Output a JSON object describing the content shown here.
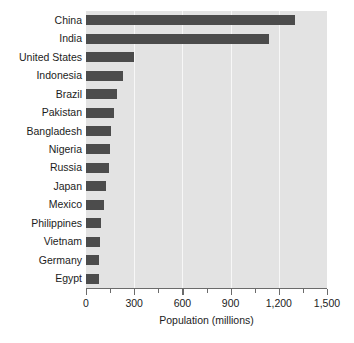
{
  "chart_data": {
    "type": "bar",
    "orientation": "horizontal",
    "title": "",
    "xlabel": "Population (millions)",
    "ylabel": "",
    "categories": [
      "China",
      "India",
      "United States",
      "Indonesia",
      "Brazil",
      "Pakistan",
      "Bangladesh",
      "Nigeria",
      "Russia",
      "Japan",
      "Mexico",
      "Philippines",
      "Vietnam",
      "Germany",
      "Egypt"
    ],
    "values": [
      1300,
      1140,
      300,
      233,
      190,
      172,
      155,
      147,
      143,
      127,
      112,
      95,
      90,
      82,
      80
    ],
    "xlim": [
      0,
      1500
    ],
    "xticks": [
      0,
      300,
      600,
      900,
      1200,
      1500
    ],
    "xticklabels": [
      "0",
      "300",
      "600",
      "900",
      "1,200",
      "1,500"
    ],
    "minor_xticks": [
      150,
      450,
      750,
      1050,
      1350
    ],
    "gridlines": [
      300,
      600,
      900,
      1200
    ],
    "grid": true,
    "legend": null,
    "series": [
      {
        "name": "Population",
        "values": [
          1300,
          1140,
          300,
          233,
          190,
          172,
          155,
          147,
          143,
          127,
          112,
          95,
          90,
          82,
          80
        ]
      }
    ]
  },
  "style": {
    "bar_color": "#4c4c4c",
    "plot_background": "#e3e3e3",
    "figure_background": "#ffffff",
    "gridline_color": "#f7f7f7",
    "axis_color": "#6b6b6b",
    "text_color": "#1c1c1c"
  }
}
